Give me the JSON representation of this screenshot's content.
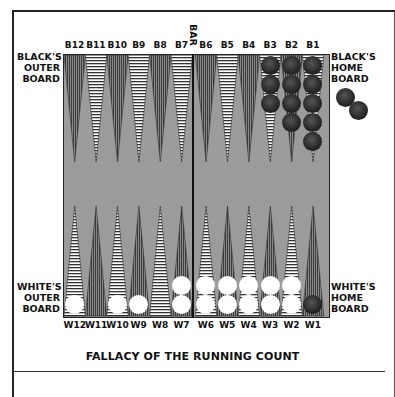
{
  "title": "FALLACY OF THE RUNNING COUNT",
  "bar_label": "BAR",
  "labels": {
    "black_outer": "BLACK'S\nOUTER\nBOARD",
    "black_home": "BLACK'S\nHOME\nBOARD",
    "white_outer": "WHITE'S\nOUTER\nBOARD",
    "white_home": "WHITE'S\nHOME\nBOARD"
  },
  "top_points": [
    "B12",
    "B11",
    "B10",
    "B9",
    "B8",
    "B7",
    "B6",
    "B5",
    "B4",
    "B3",
    "B2",
    "B1"
  ],
  "bottom_points": [
    "W12",
    "W11",
    "W10",
    "W9",
    "W8",
    "W7",
    "W6",
    "W5",
    "W4",
    "W3",
    "W2",
    "W1"
  ],
  "position": {
    "black": {
      "B3": 3,
      "B2": 4,
      "B1": 5,
      "W1": 1,
      "borne_off": 2
    },
    "white": {
      "W12": 1,
      "W10": 1,
      "W9": 1,
      "W7": 2,
      "W6": 2,
      "W5": 2,
      "W4": 2,
      "W3": 2,
      "W2": 2
    }
  }
}
